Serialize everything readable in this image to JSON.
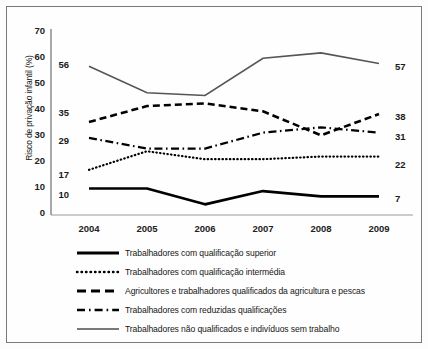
{
  "chart_data": {
    "type": "line",
    "title": "",
    "xlabel": "",
    "ylabel": "Risco de privação infantil (%)",
    "categories": [
      "2004",
      "2005",
      "2006",
      "2007",
      "2008",
      "2009"
    ],
    "x": [
      2004,
      2005,
      2006,
      2007,
      2008,
      2009
    ],
    "ylim": [
      0,
      70
    ],
    "yticks": [
      0,
      10,
      20,
      30,
      40,
      50,
      60,
      70
    ],
    "grid": false,
    "legend_position": "bottom",
    "series": [
      {
        "name": "Trabalhadores com qualificação superior",
        "style": "solid-thick",
        "color": "#000000",
        "values": [
          10,
          10,
          4,
          9,
          7,
          7
        ],
        "start_label": "10",
        "end_label": "7"
      },
      {
        "name": "Trabalhadores com qualificação intermédia",
        "style": "dotted",
        "color": "#000000",
        "values": [
          17,
          24,
          21,
          21,
          22,
          22
        ],
        "start_label": "17",
        "end_label": "22"
      },
      {
        "name": "Agricultores e trabalhadores qualificados da agricultura e pescas",
        "style": "dashed",
        "color": "#000000",
        "values": [
          35,
          41,
          42,
          39,
          30,
          38
        ],
        "start_label": "35",
        "end_label": "38"
      },
      {
        "name": "Trabalhadores com reduzidas qualificações",
        "style": "dash-dot",
        "color": "#000000",
        "values": [
          29,
          25,
          25,
          31,
          33,
          31
        ],
        "start_label": "29",
        "end_label": "31"
      },
      {
        "name": "Trabalhadores não qualificados e indivíduos sem trabalho",
        "style": "solid-thin",
        "color": "#555555",
        "values": [
          56,
          46,
          45,
          59,
          61,
          57
        ],
        "start_label": "56",
        "end_label": "57"
      }
    ]
  },
  "axis": {
    "y_title": "Risco de privação infantil (%)",
    "y_ticks": [
      "70",
      "60",
      "50",
      "40",
      "30",
      "20",
      "10",
      "0"
    ],
    "x_ticks": [
      "2004",
      "2005",
      "2006",
      "2007",
      "2008",
      "2009"
    ]
  },
  "labels": {
    "start": [
      "56",
      "35",
      "29",
      "17",
      "10"
    ],
    "end": [
      "57",
      "38",
      "31",
      "22",
      "7"
    ]
  },
  "legend": {
    "items": [
      {
        "label": "Trabalhadores com qualificação superior",
        "style": "solid-thick"
      },
      {
        "label": "Trabalhadores com qualificação intermédia",
        "style": "dotted"
      },
      {
        "label": "Agricultores e trabalhadores qualificados da agricultura e pescas",
        "style": "dashed"
      },
      {
        "label": "Trabalhadores com reduzidas qualificações",
        "style": "dash-dot"
      },
      {
        "label": "Trabalhadores não qualificados e indivíduos sem trabalho",
        "style": "solid-thin"
      }
    ]
  }
}
